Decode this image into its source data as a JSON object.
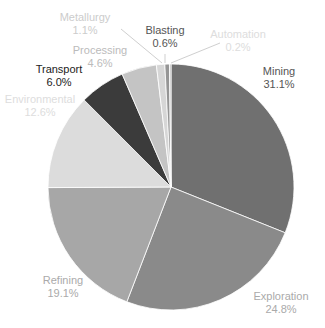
{
  "chart_data": {
    "type": "pie",
    "title": "",
    "start_angle_deg": 0,
    "direction": "clockwise",
    "center": [
      171,
      187
    ],
    "radius": 123,
    "slices": [
      {
        "label": "Mining",
        "value": 31.1,
        "pct_text": "31.1%",
        "color": "#707070",
        "label_color": "#555555",
        "label_pos": [
          279,
          75
        ],
        "leader": null
      },
      {
        "label": "Exploration",
        "value": 24.8,
        "pct_text": "24.8%",
        "color": "#8a8a8a",
        "label_color": "#aaaaaa",
        "label_pos": [
          281,
          300
        ],
        "leader": null
      },
      {
        "label": "Refining",
        "value": 19.1,
        "pct_text": "19.1%",
        "color": "#a7a7a7",
        "label_color": "#aaaaaa",
        "label_pos": [
          63,
          284
        ],
        "leader": null
      },
      {
        "label": "Environmental",
        "value": 12.6,
        "pct_text": "12.6%",
        "color": "#dcdcdc",
        "label_color": "#dddddd",
        "label_pos": [
          40,
          103
        ],
        "leader": null
      },
      {
        "label": "Transport",
        "value": 6.0,
        "pct_text": "6.0%",
        "color": "#3b3b3b",
        "label_color": "#222222",
        "label_pos": [
          59,
          73
        ],
        "leader": null
      },
      {
        "label": "Processing",
        "value": 4.6,
        "pct_text": "4.6%",
        "color": "#c4c4c4",
        "label_color": "#bbbbbb",
        "label_pos": [
          100,
          54
        ],
        "leader": null
      },
      {
        "label": "Metallurgy",
        "value": 1.1,
        "pct_text": "1.1%",
        "color": "#d6d6d6",
        "label_color": "#cccccc",
        "label_pos": [
          85,
          21
        ],
        "leader": [
          [
            121,
            29
          ],
          [
            162,
            63
          ]
        ]
      },
      {
        "label": "Blasting",
        "value": 0.6,
        "pct_text": "0.6%",
        "color": "#959595",
        "label_color": "#555555",
        "label_pos": [
          165,
          34
        ],
        "leader": [
          [
            165,
            54
          ],
          [
            165,
            63
          ]
        ]
      },
      {
        "label": "Automation",
        "value": 0.2,
        "pct_text": "0.2%",
        "color": "#b5b5b5",
        "label_color": "#dddddd",
        "label_pos": [
          238,
          38
        ],
        "leader": [
          [
            171,
            63
          ],
          [
            220,
            43
          ]
        ]
      }
    ],
    "legend": null
  }
}
